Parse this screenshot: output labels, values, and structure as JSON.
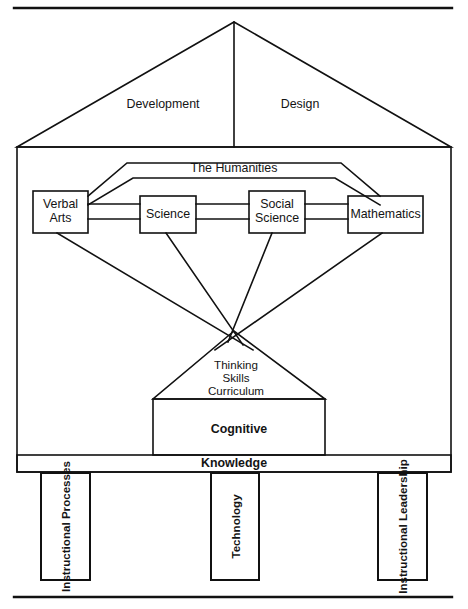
{
  "diagram": {
    "title_visible": false,
    "stroke_color": "#111111",
    "text_color": "#141414",
    "background": "#ffffff",
    "roof": {
      "left_label": "Development",
      "right_label": "Design"
    },
    "arch": {
      "label": "The Humanities"
    },
    "subject_boxes": [
      {
        "label": "Verbal\nArts"
      },
      {
        "label": "Science"
      },
      {
        "label": "Social\nScience"
      },
      {
        "label": "Mathematics"
      }
    ],
    "triangle": {
      "label": "Thinking\nSkills\nCurriculum"
    },
    "cognitive": {
      "label": "Cognitive"
    },
    "knowledge": {
      "label": "Knowledge"
    },
    "pillars": [
      {
        "label": "Instructional\nProcesses"
      },
      {
        "label": "Technology"
      },
      {
        "label": "Instructional\nLeadership"
      }
    ]
  }
}
